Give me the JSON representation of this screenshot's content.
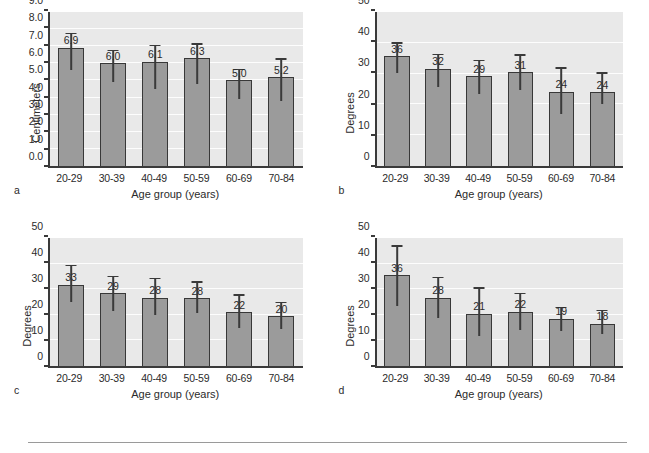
{
  "figure": {
    "panel_letters": [
      "a",
      "b",
      "c",
      "d"
    ],
    "xlabel": "Age group (years)",
    "categories": [
      "20-29",
      "30-39",
      "40-49",
      "50-59",
      "60-69",
      "70-84"
    ],
    "bar_color": "#9b9b9b",
    "bar_border_color": "#383838",
    "plot_background": "#e9e9e9",
    "gridline_color": "#fdfdfd"
  },
  "chart_data": [
    {
      "type": "bar",
      "panel": "a",
      "title": "Anterior flexion",
      "xlabel": "Age group (years)",
      "ylabel": "Centimeters",
      "categories": [
        "20-29",
        "30-39",
        "40-49",
        "50-59",
        "60-69",
        "70-84"
      ],
      "values": [
        6.9,
        6.0,
        6.1,
        6.3,
        5.0,
        5.2
      ],
      "labels": [
        "6.9",
        "6.0",
        "6.1",
        "6.3",
        "5.0",
        "5.2"
      ],
      "err_low": [
        5.6,
        4.9,
        4.5,
        4.8,
        3.9,
        3.8
      ],
      "err_high": [
        7.7,
        6.7,
        7.0,
        7.1,
        5.6,
        6.2
      ],
      "ylim": [
        0.0,
        9.0
      ],
      "yticks": [
        "0.0",
        "1.0",
        "2.0",
        "3.0",
        "4.0",
        "5.0",
        "6.0",
        "7.0",
        "8.0",
        "9.0"
      ],
      "ytick_values": [
        0,
        1,
        2,
        3,
        4,
        5,
        6,
        7,
        8,
        9
      ],
      "grid": true,
      "legend": "none"
    },
    {
      "type": "bar",
      "panel": "b",
      "title": "Right lateral flexion",
      "xlabel": "Age group (years)",
      "ylabel": "Degrees",
      "categories": [
        "20-29",
        "30-39",
        "40-49",
        "50-59",
        "60-69",
        "70-84"
      ],
      "values": [
        35.7,
        31.6,
        29.1,
        30.5,
        24.1,
        24.0
      ],
      "labels": [
        "36",
        "32",
        "29",
        "31",
        "24",
        "24"
      ],
      "err_low": [
        30.2,
        25.7,
        23.5,
        24.6,
        16.9,
        20.2
      ],
      "err_high": [
        39.6,
        36.0,
        34.0,
        35.8,
        31.5,
        30.0
      ],
      "ylim": [
        0,
        50
      ],
      "yticks": [
        "0",
        "10",
        "20",
        "30",
        "40",
        "50"
      ],
      "ytick_values": [
        0,
        10,
        20,
        30,
        40,
        50
      ],
      "grid": true,
      "legend": "none"
    },
    {
      "type": "bar",
      "panel": "c",
      "title": "Left lateral flexion",
      "xlabel": "Age group (years)",
      "ylabel": "Degrees",
      "categories": [
        "20-29",
        "30-39",
        "40-49",
        "50-59",
        "60-69",
        "70-84"
      ],
      "values": [
        31.8,
        28.5,
        26.6,
        26.5,
        21.0,
        19.4
      ],
      "labels": [
        "33",
        "29",
        "28",
        "28",
        "22",
        "20"
      ],
      "err_low": [
        25.1,
        21.4,
        19.8,
        20.9,
        14.8,
        14.6
      ],
      "err_high": [
        39.0,
        34.6,
        33.8,
        32.4,
        27.4,
        24.5
      ],
      "ylim": [
        0,
        50
      ],
      "yticks": [
        "0",
        "10",
        "20",
        "30",
        "40",
        "50"
      ],
      "ytick_values": [
        0,
        10,
        20,
        30,
        40,
        50
      ],
      "grid": true,
      "legend": "none"
    },
    {
      "type": "bar",
      "panel": "d",
      "title": "Extension",
      "xlabel": "Age group (years)",
      "ylabel": "Degrees",
      "categories": [
        "20-29",
        "30-39",
        "40-49",
        "50-59",
        "60-69",
        "70-84"
      ],
      "values": [
        35.4,
        26.7,
        20.4,
        21.2,
        18.4,
        16.6
      ],
      "labels": [
        "36",
        "28",
        "21",
        "22",
        "19",
        "18"
      ],
      "err_low": [
        23.4,
        18.7,
        11.9,
        14.2,
        13.5,
        12.4
      ],
      "err_high": [
        46.6,
        34.3,
        30.2,
        28.0,
        22.6,
        21.4
      ],
      "ylim": [
        0,
        50
      ],
      "yticks": [
        "0",
        "10",
        "20",
        "30",
        "40",
        "50"
      ],
      "ytick_values": [
        0,
        10,
        20,
        30,
        40,
        50
      ],
      "grid": true,
      "legend": "none"
    }
  ]
}
